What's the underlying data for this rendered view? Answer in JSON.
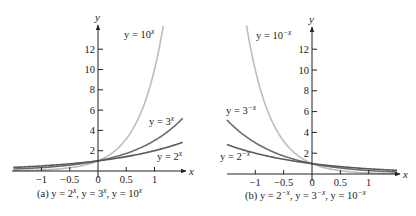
{
  "chart_data": [
    {
      "type": "line",
      "panel": "a",
      "title": "",
      "caption": "(a) y = 2^x, y = 3^x, y = 10^x",
      "xlabel": "x",
      "ylabel": "y",
      "xlim": [
        -1.5,
        1.5
      ],
      "ylim": [
        0,
        14
      ],
      "x_ticks": [
        -1,
        -0.5,
        0,
        0.5,
        1
      ],
      "x_tick_labels": [
        "−1",
        "−0.5",
        "0",
        "0.5",
        "1"
      ],
      "y_ticks": [
        2,
        4,
        6,
        8,
        10,
        12
      ],
      "y_tick_labels": [
        "2",
        "4",
        "6",
        "8",
        "10",
        "12"
      ],
      "grid": false,
      "series": [
        {
          "name": "y = 2^x",
          "base": 2,
          "sign": 1,
          "x_range": [
            -1.5,
            1.5
          ],
          "color": "#5a5a5a",
          "x": [
            -1.5,
            -1,
            -0.5,
            0,
            0.5,
            1,
            1.5
          ],
          "values": [
            0.354,
            0.5,
            0.707,
            1,
            1.414,
            2,
            2.828
          ]
        },
        {
          "name": "y = 3^x",
          "base": 3,
          "sign": 1,
          "x_range": [
            -1.5,
            1.5
          ],
          "color": "#6e6e6e",
          "x": [
            -1.5,
            -1,
            -0.5,
            0,
            0.5,
            1,
            1.5
          ],
          "values": [
            0.192,
            0.333,
            0.577,
            1,
            1.732,
            3,
            5.196
          ]
        },
        {
          "name": "y = 10^x",
          "base": 10,
          "sign": 1,
          "x_range": [
            -1.5,
            1.155
          ],
          "color": "#bdbdbd",
          "x": [
            -1.5,
            -1,
            -0.5,
            0,
            0.5,
            1,
            1.155
          ],
          "values": [
            0.032,
            0.1,
            0.316,
            1,
            3.162,
            10,
            14.3
          ]
        }
      ]
    },
    {
      "type": "line",
      "panel": "b",
      "title": "",
      "caption": "(b) y = 2^−x, y = 3^−x, y = 10^−x",
      "xlabel": "x",
      "ylabel": "y",
      "xlim": [
        -1.5,
        1.5
      ],
      "ylim": [
        0,
        14
      ],
      "x_ticks": [
        -1,
        -0.5,
        0,
        0.5,
        1
      ],
      "x_tick_labels": [
        "−1",
        "−0.5",
        "0",
        "0.5",
        "1"
      ],
      "y_ticks": [
        2,
        4,
        6,
        8,
        10,
        12
      ],
      "y_tick_labels": [
        "2",
        "4",
        "6",
        "8",
        "10",
        "12"
      ],
      "grid": false,
      "series": [
        {
          "name": "y = 2^−x",
          "base": 2,
          "sign": -1,
          "x_range": [
            -1.5,
            1.5
          ],
          "color": "#5a5a5a",
          "x": [
            -1.5,
            -1,
            -0.5,
            0,
            0.5,
            1,
            1.5
          ],
          "values": [
            2.828,
            2,
            1.414,
            1,
            0.707,
            0.5,
            0.354
          ]
        },
        {
          "name": "y = 3^−x",
          "base": 3,
          "sign": -1,
          "x_range": [
            -1.5,
            1.5
          ],
          "color": "#6e6e6e",
          "x": [
            -1.5,
            -1,
            -0.5,
            0,
            0.5,
            1,
            1.5
          ],
          "values": [
            5.196,
            3,
            1.732,
            1,
            0.577,
            0.333,
            0.192
          ]
        },
        {
          "name": "y = 10^−x",
          "base": 10,
          "sign": -1,
          "x_range": [
            -1.155,
            1.5
          ],
          "color": "#bdbdbd",
          "x": [
            -1.155,
            -1,
            -0.5,
            0,
            0.5,
            1,
            1.5
          ],
          "values": [
            14.3,
            10,
            3.162,
            1,
            0.316,
            0.1,
            0.032
          ]
        }
      ]
    }
  ],
  "panels": {
    "a": {
      "y_axis_label": "y",
      "x_axis_label": "x",
      "label_10": {
        "prefix": "y = 10",
        "exp": "x"
      },
      "label_3": {
        "prefix": "y = 3",
        "exp": "x"
      },
      "label_2": {
        "prefix": "y = 2",
        "exp": "x"
      },
      "caption": {
        "tag": "(a) ",
        "p1": "y = 2",
        "e1": "x",
        "p2": ", y = 3",
        "e2": "x",
        "p3": ", y = 10",
        "e3": "x"
      }
    },
    "b": {
      "y_axis_label": "y",
      "x_axis_label": "x",
      "label_10": {
        "prefix": "y = 10",
        "exp": "−x"
      },
      "label_3": {
        "prefix": "y = 3",
        "exp": "−x"
      },
      "label_2": {
        "prefix": "y = 2",
        "exp": "−x"
      },
      "caption": {
        "tag": "(b) ",
        "p1": "y = 2",
        "e1": "−x",
        "p2": ", y = 3",
        "e2": "−x",
        "p3": ", y = 10",
        "e3": "−x"
      }
    }
  }
}
